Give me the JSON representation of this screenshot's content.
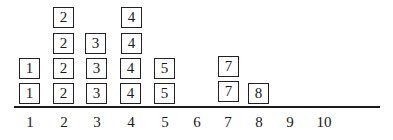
{
  "diagram": {
    "type": "dot-plot",
    "axis_labels": [
      "1",
      "2",
      "3",
      "4",
      "5",
      "6",
      "7",
      "8",
      "9",
      "10"
    ],
    "columns": [
      {
        "value": "1",
        "count": 2
      },
      {
        "value": "2",
        "count": 4
      },
      {
        "value": "3",
        "count": 3
      },
      {
        "value": "4",
        "count": 4
      },
      {
        "value": "5",
        "count": 2
      },
      {
        "value": "6",
        "count": 0
      },
      {
        "value": "7",
        "count": 2
      },
      {
        "value": "8",
        "count": 1
      },
      {
        "value": "9",
        "count": 0
      },
      {
        "value": "10",
        "count": 0
      }
    ],
    "boxes": [
      {
        "label": "1",
        "x": 19,
        "y": 83
      },
      {
        "label": "1",
        "x": 19,
        "y": 58
      },
      {
        "label": "2",
        "x": 53,
        "y": 83
      },
      {
        "label": "2",
        "x": 53,
        "y": 58
      },
      {
        "label": "2",
        "x": 53,
        "y": 33
      },
      {
        "label": "2",
        "x": 53,
        "y": 7
      },
      {
        "label": "3",
        "x": 86,
        "y": 83
      },
      {
        "label": "3",
        "x": 86,
        "y": 58
      },
      {
        "label": "3",
        "x": 85,
        "y": 33
      },
      {
        "label": "4",
        "x": 120,
        "y": 83
      },
      {
        "label": "4",
        "x": 120,
        "y": 58
      },
      {
        "label": "4",
        "x": 121,
        "y": 33
      },
      {
        "label": "4",
        "x": 121,
        "y": 7
      },
      {
        "label": "5",
        "x": 154,
        "y": 83
      },
      {
        "label": "5",
        "x": 154,
        "y": 58
      },
      {
        "label": "7",
        "x": 218,
        "y": 81
      },
      {
        "label": "7",
        "x": 218,
        "y": 56
      },
      {
        "label": "8",
        "x": 248,
        "y": 83
      }
    ],
    "tick_positions": [
      30,
      64,
      97,
      131,
      165,
      197,
      228,
      259,
      290,
      324
    ]
  }
}
